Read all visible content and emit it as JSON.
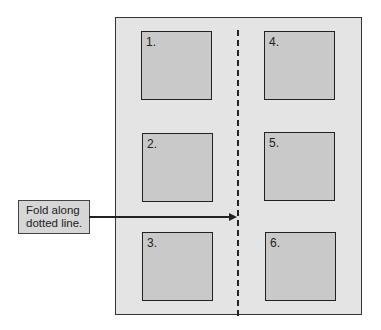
{
  "diagram": {
    "boxes": [
      {
        "label": "1."
      },
      {
        "label": "2."
      },
      {
        "label": "3."
      },
      {
        "label": "4."
      },
      {
        "label": "5."
      },
      {
        "label": "6."
      }
    ],
    "callout": {
      "line1": "Fold along",
      "line2": "dotted line."
    }
  }
}
